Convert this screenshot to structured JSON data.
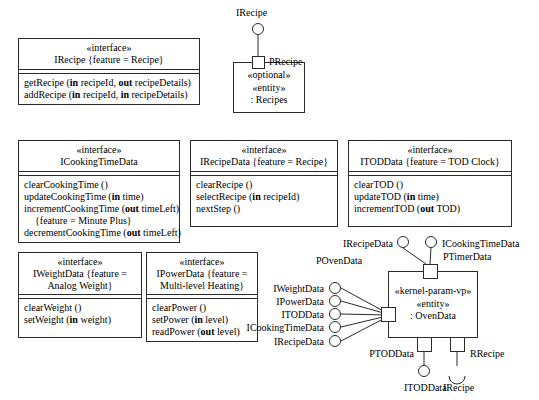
{
  "diagram": {
    "stroke_color": "#2b2b2b",
    "background_color": "#ffffff"
  },
  "interfaces": [
    {
      "id": "irecipe",
      "stereotype": "«interface»",
      "name": "IRecipe {feature = Recipe}",
      "operations": [
        {
          "text": "getRecipe (in recipeId, out recipeDetails)",
          "indent": false
        },
        {
          "text": "addRecipe (in recipeId, in recipeDetails)",
          "indent": false
        }
      ]
    },
    {
      "id": "icookingtimedata",
      "stereotype": "«interface»",
      "name": "ICookingTimeData",
      "operations": [
        {
          "text": "clearCookingTime ()",
          "indent": false
        },
        {
          "text": "updateCookingTime (in time)",
          "indent": false
        },
        {
          "text": "incrementCookingTime (out timeLeft)",
          "indent": false
        },
        {
          "text": "{feature = Minute Plus}",
          "indent": true
        },
        {
          "text": "decrementCookingTime (out timeLeft)",
          "indent": false
        }
      ]
    },
    {
      "id": "irecipedata",
      "stereotype": "«interface»",
      "name": "IRecipeData {feature = Recipe}",
      "operations": [
        {
          "text": "clearRecipe ()",
          "indent": false
        },
        {
          "text": "selectRecipe (in recipeId)",
          "indent": false
        },
        {
          "text": "nextStep ()",
          "indent": false
        }
      ]
    },
    {
      "id": "itoddata",
      "stereotype": "«interface»",
      "name": "ITODData {feature = TOD Clock}",
      "operations": [
        {
          "text": "clearTOD ()",
          "indent": false
        },
        {
          "text": "updateTOD (in time)",
          "indent": false
        },
        {
          "text": "incrementTOD (out TOD)",
          "indent": false
        }
      ]
    },
    {
      "id": "iweightdata",
      "stereotype": "«interface»",
      "name": "IWeightData {feature = Analog Weight}",
      "operations": [
        {
          "text": "clearWeight ()",
          "indent": false
        },
        {
          "text": "setWeight (in weight)",
          "indent": false
        }
      ]
    },
    {
      "id": "ipowerdata",
      "stereotype": "«interface»",
      "name": "IPowerData {feature = Multi-level Heating}",
      "operations": [
        {
          "text": "clearPower ()",
          "indent": false
        },
        {
          "text": "setPower (in level)",
          "indent": false
        },
        {
          "text": "readPower (out level)",
          "indent": false
        }
      ]
    }
  ],
  "components": [
    {
      "id": "recipes",
      "stereotype1": "«optional»",
      "stereotype2": "«entity»",
      "name": ": Recipes",
      "port_label": "PRecipe",
      "provided_interface": "IRecipe"
    },
    {
      "id": "ovendata",
      "stereotype1": "«kernel-param-vp»",
      "stereotype2": "«entity»",
      "name": ": OvenData"
    }
  ],
  "ovendata_ports": {
    "povendata": {
      "label": "POvenData",
      "provided_interfaces": [
        "IWeightData",
        "IPowerData",
        "ITODData",
        "ICookingTimeData",
        "IRecipeData"
      ]
    },
    "ptimerdata": {
      "label": "PTimerData",
      "provided_interfaces": [
        "IRecipeData",
        "ICookingTimeData"
      ]
    },
    "ptoddata": {
      "label": "PTODData",
      "provided_interfaces": [
        "ITODData"
      ]
    },
    "rrecipe": {
      "label": "RRecipe",
      "required_interfaces": [
        "IRecipe"
      ]
    }
  }
}
